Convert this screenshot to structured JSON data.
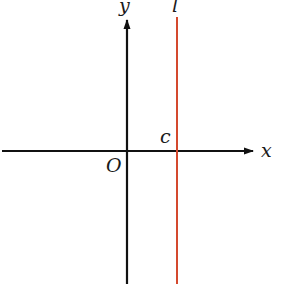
{
  "diagram": {
    "labels": {
      "y_axis": "y",
      "x_axis": "x",
      "origin": "O",
      "line_name": "l",
      "intercept": "c"
    },
    "colors": {
      "axis": "#111111",
      "line": "#d4492e",
      "background": "#ffffff"
    }
  }
}
